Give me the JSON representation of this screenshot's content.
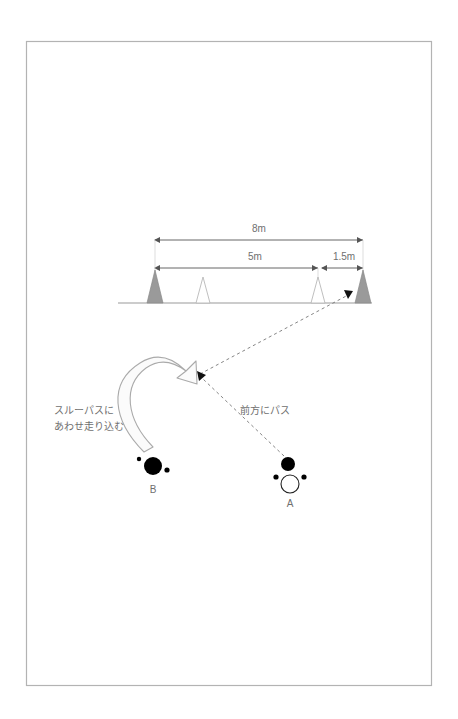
{
  "page": {
    "background_color": "#ffffff",
    "border_color": "#b3b3b3",
    "text_color": "#6f6f6f"
  },
  "diagram": {
    "title": "",
    "type": "soccer-drill-diagram",
    "dimensions": [
      {
        "id": "total",
        "label": "8m",
        "from_x": 155,
        "to_x": 363,
        "y": 240
      },
      {
        "id": "middle",
        "label": "5m",
        "from_x": 155,
        "to_x": 318,
        "y": 268
      },
      {
        "id": "gap",
        "label": "1.5m",
        "from_x": 318,
        "to_x": 363,
        "y": 268
      }
    ],
    "cones": [
      {
        "id": "cone-1",
        "x": 155,
        "style": "filled",
        "fill": "#9a9a9a"
      },
      {
        "id": "cone-2",
        "x": 203,
        "style": "outline",
        "fill": "#ffffff"
      },
      {
        "id": "cone-3",
        "x": 318,
        "style": "outline",
        "fill": "#ffffff"
      },
      {
        "id": "cone-4",
        "x": 363,
        "style": "filled",
        "fill": "#9a9a9a"
      }
    ],
    "ground_line": {
      "from_x": 118,
      "to_x": 372,
      "y": 303,
      "color": "#9a9a9a"
    },
    "players": [
      {
        "id": "player-b",
        "label": "B",
        "x": 153,
        "y": 466,
        "style": "filled",
        "fill": "#000000"
      },
      {
        "id": "player-a",
        "label": "A",
        "x": 290,
        "y": 484,
        "style": "outline",
        "fill": "#ffffff"
      }
    ],
    "ball": {
      "id": "ball",
      "x": 288,
      "y": 464,
      "fill": "#000000"
    },
    "pass_lines": [
      {
        "id": "pass-from-a",
        "label": "前方にパス",
        "from_x": 284,
        "from_y": 455,
        "to_x": 196,
        "to_y": 377
      },
      {
        "id": "through-pass-to-goal",
        "from_x": 196,
        "from_y": 377,
        "to_x": 348,
        "to_y": 295
      }
    ],
    "run_arrow": {
      "id": "run-arrow-b",
      "description": "curved-run-arrow"
    },
    "annotations": [
      {
        "id": "annotation-run",
        "lines": [
          "スルーパスに",
          "あわせ走り込む"
        ],
        "x": 54,
        "y": 412
      },
      {
        "id": "annotation-pass",
        "lines": [
          "前方にパス"
        ],
        "x": 240,
        "y": 412
      }
    ]
  }
}
